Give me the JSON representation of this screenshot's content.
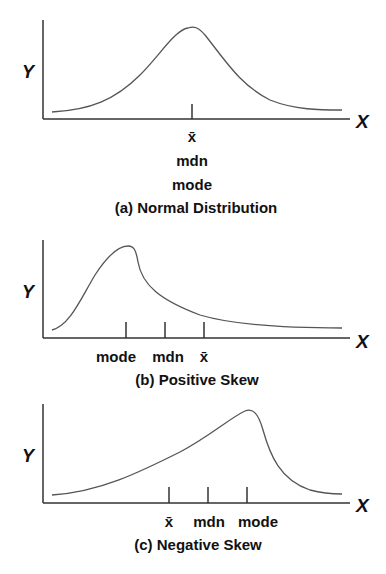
{
  "panels": [
    {
      "caption": "(a) Normal Distribution",
      "y_axis_label": "Y",
      "x_axis_label": "X",
      "markers": [
        "x̄",
        "mdn",
        "mode"
      ],
      "shape": "symmetric"
    },
    {
      "caption": "(b) Positive Skew",
      "y_axis_label": "Y",
      "x_axis_label": "X",
      "markers": [
        "mode",
        "mdn",
        "x̄"
      ],
      "shape": "right-skewed"
    },
    {
      "caption": "(c) Negative Skew",
      "y_axis_label": "Y",
      "x_axis_label": "X",
      "markers": [
        "x̄",
        "mdn",
        "mode"
      ],
      "shape": "left-skewed"
    }
  ],
  "colors": {
    "line": "#444444",
    "text": "#111111",
    "background": "#ffffff"
  }
}
